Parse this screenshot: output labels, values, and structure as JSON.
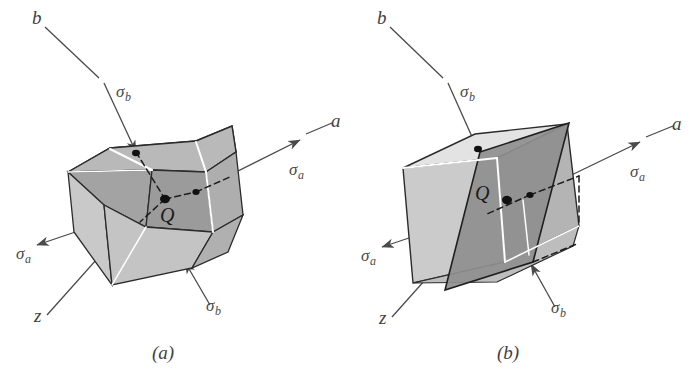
{
  "figure": {
    "background_color": "#ffffff",
    "line_color": "#4a4a4a",
    "edge_color": "#2b2b2b",
    "colors": {
      "face_light": "#e6e6e6",
      "face_midlight": "#cfcfcf",
      "face_mid": "#b6b6b6",
      "face_dark": "#9a9a9a",
      "face_darker": "#8a8a8a",
      "highlight_white": "#ffffff",
      "marker": "#111111"
    }
  },
  "panels": [
    {
      "id": "a",
      "caption": "(a)",
      "axes": [
        {
          "name": "b",
          "label": "b"
        },
        {
          "name": "a",
          "label": "a"
        },
        {
          "name": "z",
          "label": "z"
        }
      ],
      "point_label": "Q",
      "stress_labels": [
        {
          "name": "sigma-b-top",
          "symbol": "σ",
          "subscript": "b"
        },
        {
          "name": "sigma-a-right",
          "symbol": "σ",
          "subscript": "a"
        },
        {
          "name": "sigma-a-left",
          "symbol": "σ",
          "subscript": "a"
        },
        {
          "name": "sigma-b-bottom",
          "symbol": "σ",
          "subscript": "b"
        }
      ]
    },
    {
      "id": "b",
      "caption": "(b)",
      "axes": [
        {
          "name": "b",
          "label": "b"
        },
        {
          "name": "a",
          "label": "a"
        },
        {
          "name": "z",
          "label": "z"
        }
      ],
      "point_label": "Q",
      "stress_labels": [
        {
          "name": "sigma-b-top",
          "symbol": "σ",
          "subscript": "b"
        },
        {
          "name": "sigma-a-right",
          "symbol": "σ",
          "subscript": "a"
        },
        {
          "name": "sigma-a-left",
          "symbol": "σ",
          "subscript": "a"
        },
        {
          "name": "sigma-b-bottom",
          "symbol": "σ",
          "subscript": "b"
        }
      ]
    }
  ]
}
